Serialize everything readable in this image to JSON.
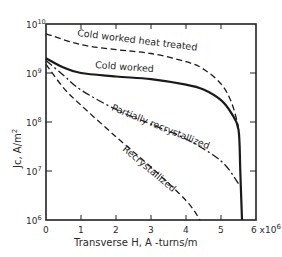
{
  "chart_data": {
    "type": "line",
    "title": "",
    "xlabel": "Transverse H,  A -turns/m",
    "ylabel": "Jc,  A/m²",
    "x_scale": "linear",
    "y_scale": "log",
    "xlim": [
      0,
      6
    ],
    "ylim": [
      1000000.0,
      10000000000.0
    ],
    "x_ticks": [
      "0",
      "1",
      "2",
      "3",
      "4",
      "5",
      "6 x10⁶"
    ],
    "x_multiplier_label": "6 x10",
    "x_multiplier_exp": "6",
    "y_ticks": [
      {
        "base": "10",
        "exp": "10",
        "value": 10000000000.0
      },
      {
        "base": "10",
        "exp": "9",
        "value": 1000000000.0
      },
      {
        "base": "10",
        "exp": "8",
        "value": 100000000.0
      },
      {
        "base": "10",
        "exp": "7",
        "value": 10000000.0
      },
      {
        "base": "10",
        "exp": "6",
        "value": 1000000.0
      }
    ],
    "grid": false,
    "legend": "inline labels on curves",
    "series": [
      {
        "name": "Cold worked heat treated",
        "style": "dashed",
        "x": [
          0,
          1,
          2,
          3,
          4,
          4.5,
          5,
          5.3,
          5.5
        ],
        "y": [
          6300000000.0,
          3800000000.0,
          3000000000.0,
          2500000000.0,
          1700000000.0,
          1200000000.0,
          600000000.0,
          250000000.0,
          80000000.0
        ]
      },
      {
        "name": "Cold worked",
        "style": "solid",
        "x": [
          0,
          0.5,
          1,
          2,
          3,
          4,
          4.5,
          5,
          5.3,
          5.5,
          5.55,
          5.6
        ],
        "y": [
          2000000000.0,
          1300000000.0,
          1000000000.0,
          850000000.0,
          750000000.0,
          580000000.0,
          460000000.0,
          280000000.0,
          150000000.0,
          70000000.0,
          10000000.0,
          1000000.0
        ]
      },
      {
        "name": "Partially recrystallized",
        "style": "dash-dot",
        "x": [
          0,
          0.5,
          1,
          2,
          3,
          4,
          5,
          5.5
        ],
        "y": [
          1800000000.0,
          900000000.0,
          450000000.0,
          180000000.0,
          90000000.0,
          45000000.0,
          16000000.0,
          5500000.0
        ]
      },
      {
        "name": "Recrystallized",
        "style": "dashed",
        "x": [
          0,
          0.5,
          1,
          2,
          3,
          4,
          4.4
        ],
        "y": [
          1500000000.0,
          500000000.0,
          220000000.0,
          50000000.0,
          12000000.0,
          2500000.0,
          1000000.0
        ]
      }
    ]
  },
  "labels": {
    "cold_worked_heat_treated": "Cold worked heat treated",
    "cold_worked": "Cold worked",
    "partially_recrystallized": "Partially recrystallized",
    "recrystallized": "Recrystallized"
  },
  "axes": {
    "ylabel_main": "Jc,  A/m",
    "ylabel_sup": "2",
    "xlabel": "Transverse H,  A -turns/m"
  }
}
